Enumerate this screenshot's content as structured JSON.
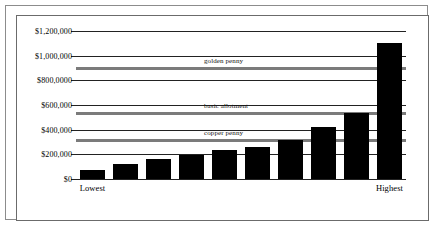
{
  "chart_data": {
    "type": "bar",
    "title": "",
    "subtitle": "",
    "xlabel": "",
    "ylabel": "",
    "ylim": [
      0,
      1200000
    ],
    "grid": true,
    "legend_position": "none",
    "categories": [
      "Lowest",
      "",
      "",
      "",
      "",
      "",
      "",
      "",
      "",
      "Highest"
    ],
    "values": [
      70000,
      125000,
      163000,
      193000,
      235000,
      262000,
      318000,
      425000,
      532000,
      1100000
    ],
    "y_ticks": [
      0,
      200000,
      400000,
      600000,
      800000,
      1000000,
      1200000
    ],
    "y_tick_labels": [
      "$0",
      "$200,000",
      "$400,000",
      "$600,000",
      "$800,0000",
      "$1,000,000",
      "$1,200,000"
    ],
    "x_tick_labels": [
      "Lowest",
      "Highest"
    ],
    "x_tick_positions": [
      0,
      9
    ],
    "reference_lines": [
      {
        "label": "golden penny",
        "value": 900000,
        "color": "#7b7b7b"
      },
      {
        "label": "basic allotment",
        "value": 532000,
        "color": "#7b7b7b"
      },
      {
        "label": "copper penny",
        "value": 320000,
        "color": "#7b7b7b"
      }
    ],
    "bar_color": "#000000",
    "gridline_color": "#222222"
  },
  "figure": {
    "border_color": "#8c8c8c",
    "background": "#ffffff"
  }
}
